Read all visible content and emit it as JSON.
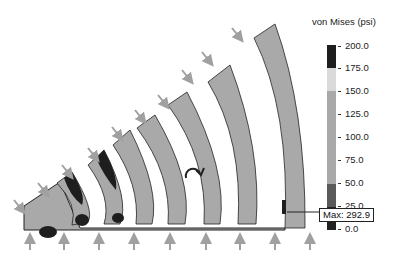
{
  "legend": {
    "title": "von Mises (psi)",
    "ticks": [
      "200.0",
      "175.0",
      "150.0",
      "125.0",
      "100.0",
      "75.0",
      "50.0",
      "25.0",
      "0.0"
    ],
    "segments": [
      {
        "from": 175,
        "to": 200,
        "color": "#1e1e1e"
      },
      {
        "from": 150,
        "to": 175,
        "color": "#dadada"
      },
      {
        "from": 50,
        "to": 150,
        "color": "#a9a9a9"
      },
      {
        "from": 25,
        "to": 50,
        "color": "#5a5a5a"
      },
      {
        "from": 0,
        "to": 25,
        "color": "#222222"
      }
    ]
  },
  "annotation": {
    "max_label": "Max: 292.9"
  },
  "model": {
    "fin_count": 8,
    "body_color": "#a9a9a9",
    "hotspot_color": "#1e1e1e",
    "load_arrow_color": "#a0a0a0",
    "rotation_icon": "rotation-arrow-icon"
  }
}
